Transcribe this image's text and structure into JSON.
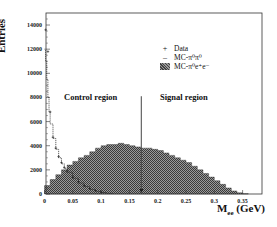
{
  "chart_data": {
    "type": "bar",
    "title": "",
    "xlabel": "M_ee (GeV)",
    "ylabel": "Entries",
    "xlim": [
      0,
      0.38
    ],
    "ylim": [
      0,
      15000
    ],
    "x_ticks": [
      "0",
      "0.05",
      "0.1",
      "0.15",
      "0.2",
      "0.25",
      "0.3",
      "0.35"
    ],
    "y_ticks": [
      "0",
      "2000",
      "4000",
      "6000",
      "8000",
      "10000",
      "12000",
      "14000"
    ],
    "bin_width": 0.01,
    "bin_edges_start": [
      0,
      0.01,
      0.02,
      0.03,
      0.04,
      0.05,
      0.06,
      0.07,
      0.08,
      0.09,
      0.1,
      0.11,
      0.12,
      0.13,
      0.14,
      0.15,
      0.16,
      0.17,
      0.18,
      0.19,
      0.2,
      0.21,
      0.22,
      0.23,
      0.24,
      0.25,
      0.26,
      0.27,
      0.28,
      0.29,
      0.3,
      0.31,
      0.32,
      0.33,
      0.34,
      0.35
    ],
    "series": [
      {
        "name": "MC-π⁰e⁺e⁻",
        "style": "hatched-filled-histogram",
        "values": [
          700,
          1200,
          1600,
          2000,
          2400,
          2700,
          3000,
          3200,
          3500,
          3800,
          4000,
          4100,
          4100,
          4200,
          4100,
          4000,
          3900,
          3800,
          3800,
          3700,
          3600,
          3400,
          3200,
          3000,
          2800,
          2600,
          2300,
          2000,
          1700,
          1400,
          1100,
          800,
          500,
          250,
          100,
          30
        ]
      },
      {
        "name": "MC-π⁰π⁰",
        "style": "line-histogram",
        "x": [
          0,
          0.002,
          0.004,
          0.006,
          0.008,
          0.01,
          0.015,
          0.02,
          0.025,
          0.03,
          0.035,
          0.04,
          0.05,
          0.06,
          0.07,
          0.08,
          0.09,
          0.1,
          0.11,
          0.12
        ],
        "values": [
          12000,
          11000,
          9500,
          8000,
          6800,
          5800,
          4600,
          3700,
          3000,
          2500,
          2100,
          1800,
          1300,
          900,
          600,
          380,
          220,
          120,
          60,
          20
        ]
      },
      {
        "name": "Data",
        "style": "points",
        "x": [
          0.002,
          0.006,
          0.01,
          0.015,
          0.02,
          0.025,
          0.03,
          0.035,
          0.04,
          0.05,
          0.06,
          0.07,
          0.08,
          0.09,
          0.1
        ],
        "values": [
          13600,
          11800,
          6800,
          4700,
          3800,
          3100,
          2600,
          2200,
          1900,
          1400,
          1000,
          700,
          450,
          280,
          160
        ]
      }
    ],
    "annotations": [
      {
        "text": "Control region",
        "x": 0.03,
        "y": 7000
      },
      {
        "text": "Signal region",
        "x": 0.17,
        "y": 7000
      },
      {
        "type": "vertical-cut-line-with-arrow",
        "x": 0.171,
        "y_top": 8100
      }
    ],
    "legend": {
      "position": "upper-right",
      "entries": [
        "Data",
        "MC-π⁰π⁰",
        "MC-π⁰e⁺e⁻"
      ]
    },
    "grid": false
  },
  "labels": {
    "ylabel": "Entries",
    "xlabel_main": "M",
    "xlabel_sub": "ee",
    "xlabel_unit": " (GeV)",
    "control_region": "Control region",
    "signal_region": "Signal region"
  },
  "legend": {
    "data": {
      "marker": "+",
      "label": "Data"
    },
    "mc_pipi": {
      "marker": "–",
      "label": "MC-π⁰π⁰"
    },
    "mc_piee": {
      "label": "MC-π⁰e⁺e⁻"
    }
  }
}
